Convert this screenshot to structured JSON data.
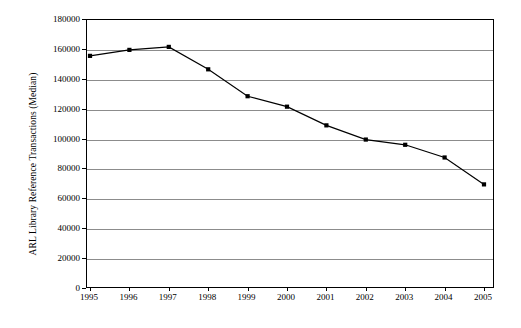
{
  "chart_data": {
    "type": "line",
    "title": "",
    "subtitle": "",
    "xlabel": "",
    "ylabel": "ARL Library Reference Transactions (Median)",
    "categories": [
      "1995",
      "1996",
      "1997",
      "1998",
      "1999",
      "2000",
      "2001",
      "2002",
      "2003",
      "2004",
      "2005"
    ],
    "x": [
      1995,
      1996,
      1997,
      1998,
      1999,
      2000,
      2001,
      2002,
      2003,
      2004,
      2005
    ],
    "values": [
      156000,
      160000,
      162000,
      147000,
      129000,
      122000,
      109500,
      100000,
      96500,
      88000,
      70000
    ],
    "series": [
      {
        "name": "ARL Library Reference Transactions (Median)",
        "values": [
          156000,
          160000,
          162000,
          147000,
          129000,
          122000,
          109500,
          100000,
          96500,
          88000,
          70000
        ]
      }
    ],
    "ylim": [
      0,
      180000
    ],
    "ytick_values": [
      0,
      20000,
      40000,
      60000,
      80000,
      100000,
      120000,
      140000,
      160000,
      180000
    ],
    "ytick_labels": [
      "0",
      "20000",
      "40000",
      "60000",
      "80000",
      "100000",
      "120000",
      "140000",
      "160000",
      "180000"
    ],
    "xtick_labels": [
      "1995",
      "1996",
      "1997",
      "1998",
      "1999",
      "2000",
      "2001",
      "2002",
      "2003",
      "2004",
      "2005"
    ],
    "grid": "horizontal",
    "legend": "none",
    "marker": "square",
    "line_color": "#000000",
    "marker_color": "#000000",
    "grid_color": "#8c8c8c",
    "axis_color": "#000000",
    "plot_background": "#ffffff",
    "annotations": []
  }
}
